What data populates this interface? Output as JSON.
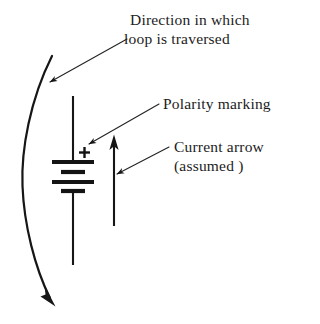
{
  "figure": {
    "background_color": "#ffffff",
    "ink_color": "#161616",
    "labels": {
      "direction_line1": "Direction in which",
      "direction_line2": "loop is traversed",
      "polarity": "Polarity marking",
      "current_line1": "Current  arrow",
      "current_line2": "(assumed )"
    },
    "symbols": {
      "polarity_sign": "+"
    },
    "annotations": [
      {
        "name": "loop-direction",
        "text": "Direction in which loop is traversed",
        "leader_from": [
          127,
          39
        ],
        "leader_to": [
          47,
          84
        ]
      },
      {
        "name": "polarity-marking",
        "text": "Polarity marking",
        "leader_from": [
          159,
          104
        ],
        "leader_to": [
          86,
          146
        ]
      },
      {
        "name": "current-arrow",
        "text": "Current arrow (assumed)",
        "leader_from": [
          169,
          147
        ],
        "leader_to": [
          114,
          176
        ]
      }
    ],
    "elements": {
      "loop_arrow": {
        "name": "traversal-curve",
        "direction": "clockwise-downward",
        "start": [
          52,
          56
        ],
        "end": [
          52,
          303
        ]
      },
      "battery": {
        "name": "battery-symbol",
        "wire_top": [
          73,
          96
        ],
        "wire_bottom": [
          73,
          265
        ],
        "plate_count": 4,
        "plates": [
          {
            "type": "long",
            "y": 162
          },
          {
            "type": "short",
            "y": 172
          },
          {
            "type": "long",
            "y": 182
          },
          {
            "type": "short",
            "y": 191
          }
        ],
        "polarity_at": [
          79,
          152
        ]
      },
      "current_arrow": {
        "name": "current-arrow-shaft",
        "direction": "up",
        "tail": [
          114,
          226
        ],
        "head": [
          114,
          138
        ]
      }
    }
  }
}
